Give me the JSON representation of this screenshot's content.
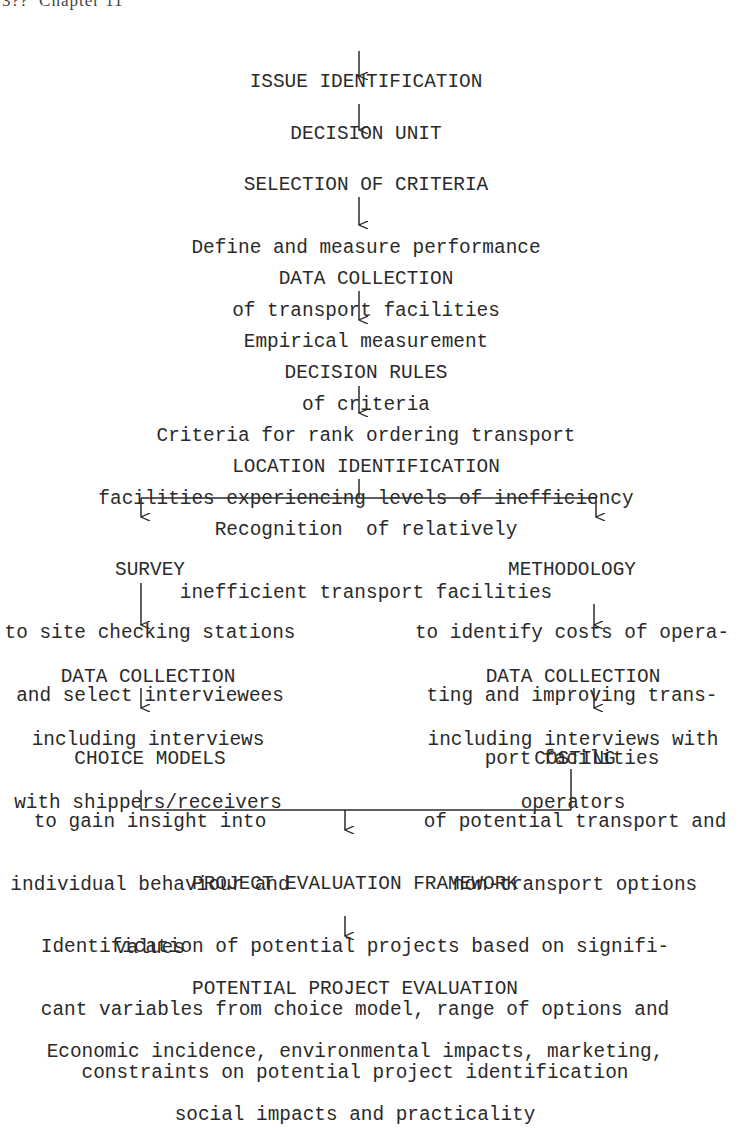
{
  "page_header": "3??  Chapter 11",
  "main_flow": [
    {
      "id": "issue",
      "title": "ISSUE IDENTIFICATION",
      "lines": []
    },
    {
      "id": "decision-unit",
      "title": "DECISION UNIT",
      "lines": []
    },
    {
      "id": "selection",
      "title": "SELECTION OF CRITERIA",
      "lines": [
        "Define and measure performance",
        "of transport facilities"
      ]
    },
    {
      "id": "data-collection-1",
      "title": "DATA COLLECTION",
      "lines": [
        "Empirical measurement",
        "of criteria"
      ]
    },
    {
      "id": "decision-rules",
      "title": "DECISION RULES",
      "lines": [
        "Criteria for rank ordering transport",
        "facilities experiencing levels of inefficiency"
      ]
    },
    {
      "id": "location",
      "title": "LOCATION IDENTIFICATION",
      "lines": [
        "Recognition  of relatively",
        "inefficient transport facilities"
      ]
    }
  ],
  "left_branch": [
    {
      "id": "survey",
      "title": "SURVEY",
      "lines": [
        "to site checking stations",
        "and select interviewees"
      ]
    },
    {
      "id": "data-collection-left",
      "title": "DATA COLLECTION",
      "lines": [
        "including interviews",
        "with shippers/receivers"
      ]
    },
    {
      "id": "choice-models",
      "title": "CHOICE MODELS",
      "lines": [
        "to gain insight into",
        "individual behaviour and",
        "values"
      ]
    }
  ],
  "right_branch": [
    {
      "id": "methodology",
      "title": "METHODOLOGY",
      "lines": [
        "to identify costs of opera-",
        "ting and improving trans-",
        "port facilities"
      ]
    },
    {
      "id": "data-collection-right",
      "title": "DATA COLLECTION",
      "lines": [
        "including interviews with",
        "operators"
      ]
    },
    {
      "id": "costing",
      "title": "COSTING",
      "lines": [
        "of potential transport and",
        "non-transport options"
      ]
    }
  ],
  "final_flow": [
    {
      "id": "framework",
      "title": "PROJECT EVALUATION FRAMEWORK",
      "lines": [
        "Identification of potential projects based on signifi-",
        "cant variables from choice model, range of options and",
        "constraints on potential project identification"
      ]
    },
    {
      "id": "potential-eval",
      "title": "POTENTIAL PROJECT EVALUATION",
      "lines": [
        "Economic incidence, environmental impacts, marketing,",
        "social impacts and practicality"
      ]
    }
  ]
}
